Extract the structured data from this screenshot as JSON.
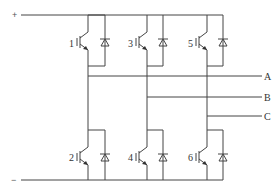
{
  "diagram": {
    "type": "three-phase IGBT inverter bridge",
    "rails": {
      "positive": "+",
      "negative": "−"
    },
    "switches": [
      {
        "label": "1",
        "position": "upper",
        "leg": 1
      },
      {
        "label": "3",
        "position": "upper",
        "leg": 2
      },
      {
        "label": "5",
        "position": "upper",
        "leg": 3
      },
      {
        "label": "2",
        "position": "lower",
        "leg": 1
      },
      {
        "label": "4",
        "position": "lower",
        "leg": 2
      },
      {
        "label": "6",
        "position": "lower",
        "leg": 3
      }
    ],
    "outputs": [
      {
        "label": "A",
        "leg": 1
      },
      {
        "label": "B",
        "leg": 2
      },
      {
        "label": "C",
        "leg": 3
      }
    ],
    "colors": {
      "line": "#444444",
      "background": "#ffffff"
    }
  }
}
